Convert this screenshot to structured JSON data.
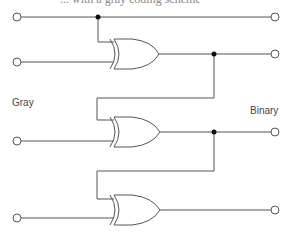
{
  "caption_fragment": "... with a gray coding scheme",
  "labels": {
    "input_group": "Gray",
    "output_group": "Binary"
  },
  "diagram": {
    "type": "gray-to-binary-converter",
    "gates": [
      "XOR",
      "XOR",
      "XOR"
    ],
    "inputs": 4,
    "outputs": 4,
    "colors": {
      "wire": "#555555",
      "junction": "#111111",
      "terminal_fill": "#ffffff"
    }
  }
}
